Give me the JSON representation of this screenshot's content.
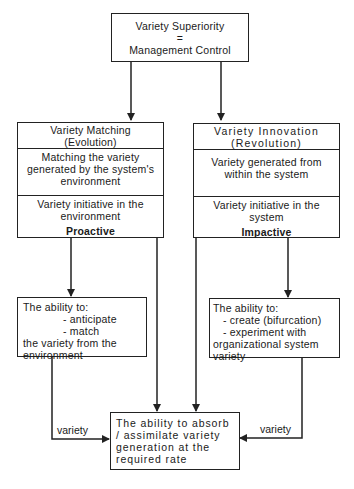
{
  "top_box": {
    "line1": "Variety Superiority",
    "line2": "=",
    "line3": "Management Control"
  },
  "left_box": {
    "title": "Variety Matching",
    "subtitle": "(Evolution)",
    "description": "Matching the variety generated by the system's environment",
    "initiative": "Variety initiative in the environment",
    "mode": "Proactive"
  },
  "right_box": {
    "title": "Variety Innovation",
    "subtitle": "(Revolution)",
    "description": "Variety generated from within the system",
    "initiative": "Variety initiative in the system",
    "mode": "Impactive"
  },
  "left_ability": {
    "intro": "The ability to:",
    "items": [
      "-  anticipate",
      "-  match"
    ],
    "outro": "the variety from the environment"
  },
  "right_ability": {
    "intro": "The ability to:",
    "items": [
      "-  create (bifurcation)",
      "-  experiment with"
    ],
    "outro": "organizational system variety"
  },
  "bottom_box": {
    "text": "The ability to absorb / assimilate variety generation at the required rate"
  },
  "edge_labels": {
    "left": "variety",
    "right": "variety"
  },
  "colors": {
    "line": "#222222",
    "background": "#ffffff"
  }
}
